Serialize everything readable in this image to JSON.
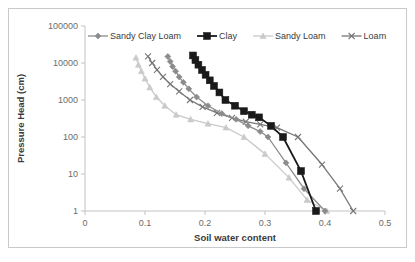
{
  "chart_data": {
    "type": "line",
    "title": "",
    "xlabel": "Soil water content",
    "ylabel": "Pressure Head (cm)",
    "xlim": [
      0,
      0.5
    ],
    "ylim": [
      1,
      100000
    ],
    "yscale": "log",
    "grid": false,
    "legend_position": "top-inside",
    "xticks": [
      "0",
      "0.1",
      "0.2",
      "0.3",
      "0.4",
      "0.5"
    ],
    "xtick_values": [
      0,
      0.1,
      0.2,
      0.3,
      0.4,
      0.5
    ],
    "yticks": [
      "100000",
      "10000",
      "1000",
      "100",
      "10",
      "1"
    ],
    "ytick_values": [
      100000,
      10000,
      1000,
      100,
      10,
      1
    ],
    "series": [
      {
        "name": "Sandy Clay Loam",
        "color": "#8c8c8c",
        "marker": "diamond",
        "points": [
          [
            0.138,
            15000
          ],
          [
            0.142,
            11000
          ],
          [
            0.146,
            8000
          ],
          [
            0.151,
            6000
          ],
          [
            0.157,
            4200
          ],
          [
            0.164,
            3000
          ],
          [
            0.173,
            2000
          ],
          [
            0.186,
            1200
          ],
          [
            0.205,
            700
          ],
          [
            0.228,
            430
          ],
          [
            0.252,
            300
          ],
          [
            0.272,
            200
          ],
          [
            0.292,
            140
          ],
          [
            0.305,
            100
          ],
          [
            0.335,
            20
          ],
          [
            0.365,
            4
          ],
          [
            0.4,
            1
          ]
        ]
      },
      {
        "name": "Clay",
        "color": "#1a1a1a",
        "marker": "square",
        "points": [
          [
            0.18,
            16000
          ],
          [
            0.184,
            12000
          ],
          [
            0.189,
            9000
          ],
          [
            0.195,
            6500
          ],
          [
            0.201,
            4800
          ],
          [
            0.208,
            3400
          ],
          [
            0.215,
            2400
          ],
          [
            0.224,
            1600
          ],
          [
            0.234,
            1000
          ],
          [
            0.25,
            700
          ],
          [
            0.265,
            500
          ],
          [
            0.278,
            400
          ],
          [
            0.29,
            340
          ],
          [
            0.31,
            200
          ],
          [
            0.33,
            100
          ],
          [
            0.36,
            12
          ],
          [
            0.385,
            1
          ]
        ]
      },
      {
        "name": "Sandy Loam",
        "color": "#cacaca",
        "marker": "triangle",
        "points": [
          [
            0.085,
            14000
          ],
          [
            0.089,
            9000
          ],
          [
            0.094,
            6000
          ],
          [
            0.1,
            3800
          ],
          [
            0.108,
            2200
          ],
          [
            0.119,
            1200
          ],
          [
            0.133,
            700
          ],
          [
            0.152,
            400
          ],
          [
            0.176,
            300
          ],
          [
            0.205,
            230
          ],
          [
            0.235,
            180
          ],
          [
            0.265,
            100
          ],
          [
            0.3,
            35
          ],
          [
            0.34,
            8
          ],
          [
            0.37,
            2
          ],
          [
            0.403,
            1
          ]
        ]
      },
      {
        "name": "Loam",
        "color": "#767676",
        "marker": "cross",
        "points": [
          [
            0.105,
            15000
          ],
          [
            0.112,
            10000
          ],
          [
            0.12,
            6500
          ],
          [
            0.13,
            4200
          ],
          [
            0.142,
            2700
          ],
          [
            0.157,
            1700
          ],
          [
            0.175,
            1000
          ],
          [
            0.196,
            650
          ],
          [
            0.22,
            450
          ],
          [
            0.245,
            330
          ],
          [
            0.268,
            260
          ],
          [
            0.292,
            220
          ],
          [
            0.32,
            180
          ],
          [
            0.355,
            100
          ],
          [
            0.395,
            18
          ],
          [
            0.425,
            4
          ],
          [
            0.447,
            1
          ]
        ]
      }
    ]
  },
  "legend": {
    "items": [
      {
        "label": "Sandy Clay Loam"
      },
      {
        "label": "Clay"
      },
      {
        "label": "Sandy Loam"
      },
      {
        "label": "Loam"
      }
    ]
  }
}
